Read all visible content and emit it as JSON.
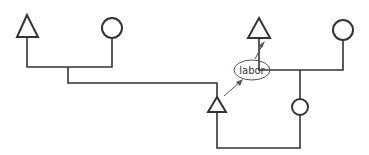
{
  "diagram": {
    "type": "kinship-chart",
    "colors": {
      "stroke": "#333333",
      "background": "#ffffff"
    },
    "nodes": [
      {
        "id": "male-left",
        "shape": "triangle",
        "gender": "male"
      },
      {
        "id": "female-left",
        "shape": "circle",
        "gender": "female"
      },
      {
        "id": "male-child",
        "shape": "triangle",
        "gender": "male"
      },
      {
        "id": "male-right",
        "shape": "triangle",
        "gender": "male"
      },
      {
        "id": "female-right",
        "shape": "circle",
        "gender": "female"
      },
      {
        "id": "female-child",
        "shape": "circle",
        "gender": "female"
      }
    ],
    "relations": [
      {
        "type": "marriage",
        "between": [
          "male-left",
          "female-left"
        ]
      },
      {
        "type": "descent",
        "from": "male-left+female-left",
        "to": "male-child"
      },
      {
        "type": "marriage",
        "between": [
          "male-right",
          "female-right"
        ]
      },
      {
        "type": "descent",
        "from": "male-right+female-right",
        "to": "female-child"
      },
      {
        "type": "marriage",
        "between": [
          "male-child",
          "female-child"
        ]
      },
      {
        "type": "exchange",
        "from": "male-child",
        "to": "male-right",
        "label": "labor"
      }
    ],
    "exchange_label": "labor"
  }
}
